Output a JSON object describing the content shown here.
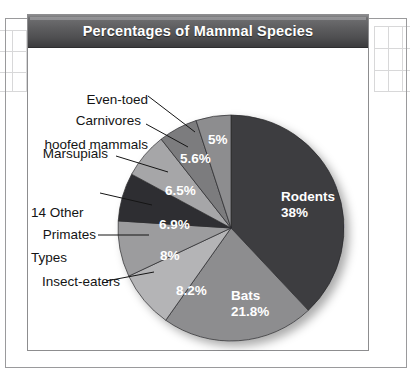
{
  "chart": {
    "title": "Percentages of Mammal Species"
  },
  "chart_data": {
    "type": "pie",
    "title": "Percentages of Mammal Species",
    "xlabel": "",
    "ylabel": "",
    "legend_position": "none",
    "grid": false,
    "units": "percent",
    "total": 100,
    "start_angle_deg": 0,
    "direction": "clockwise",
    "categories": [
      "Rodents",
      "Bats",
      "Insect-eaters",
      "Primates",
      "14 Other Types",
      "Marsupials",
      "Carnivores",
      "Even-toed hoofed mammals"
    ],
    "values": [
      38,
      21.8,
      8.2,
      8,
      6.9,
      6.5,
      5.6,
      5
    ],
    "value_labels": [
      "38%",
      "21.8%",
      "8.2%",
      "8%",
      "6.9%",
      "6.5%",
      "5.6%",
      "5%"
    ],
    "colors": [
      "#3d3d3f",
      "#8d8d8f",
      "#b4b4b6",
      "#9c9c9e",
      "#2f2f31",
      "#a6a6a8",
      "#7c7c7e",
      "#8d8d8f"
    ],
    "slices": [
      {
        "name": "Rodents",
        "value": 38,
        "label": "Rodents",
        "value_label": "38%",
        "color": "#3d3d3f",
        "label_placement": "inside"
      },
      {
        "name": "Bats",
        "value": 21.8,
        "label": "Bats",
        "value_label": "21.8%",
        "color": "#8d8d8f",
        "label_placement": "inside"
      },
      {
        "name": "Insect-eaters",
        "value": 8.2,
        "label": "Insect-eaters",
        "value_label": "8.2%",
        "color": "#b4b4b6",
        "label_placement": "outside-left"
      },
      {
        "name": "Primates",
        "value": 8,
        "label": "Primates",
        "value_label": "8%",
        "color": "#9c9c9e",
        "label_placement": "outside-left"
      },
      {
        "name": "14 Other Types",
        "value": 6.9,
        "label": "14 Other\nTypes",
        "value_label": "6.9%",
        "color": "#2f2f31",
        "label_placement": "outside-left"
      },
      {
        "name": "Marsupials",
        "value": 6.5,
        "label": "Marsupials",
        "value_label": "6.5%",
        "color": "#a6a6a8",
        "label_placement": "outside-left"
      },
      {
        "name": "Carnivores",
        "value": 5.6,
        "label": "Carnivores",
        "value_label": "5.6%",
        "color": "#7c7c7e",
        "label_placement": "outside-left"
      },
      {
        "name": "Even-toed hoofed mammals",
        "value": 5,
        "label": "Even-toed\nhoofed mammals",
        "value_label": "5%",
        "color": "#8d8d8f",
        "label_placement": "outside-top"
      }
    ]
  },
  "labels": {
    "even_toed_line1": "Even-toed",
    "even_toed_line2": "hoofed mammals",
    "carnivores": "Carnivores",
    "marsupials": "Marsupials",
    "other_line1": "14 Other",
    "other_line2": "Types",
    "primates": "Primates",
    "insect_eaters": "Insect-eaters",
    "rodents_name": "Rodents",
    "rodents_value": "38%",
    "bats_name": "Bats",
    "bats_value": "21.8%",
    "v_5": "5%",
    "v_56": "5.6%",
    "v_65": "6.5%",
    "v_69": "6.9%",
    "v_8": "8%",
    "v_82": "8.2%"
  }
}
